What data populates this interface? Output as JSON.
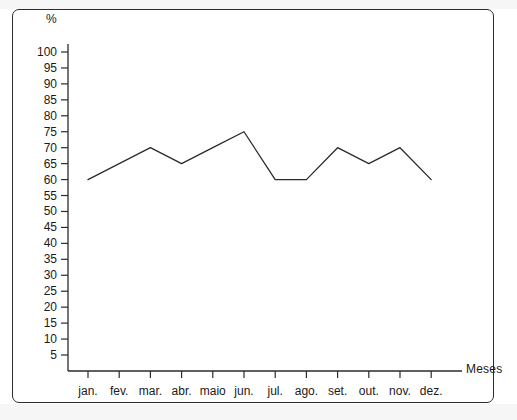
{
  "figure": {
    "y_unit_label": "%",
    "x_axis_label": "Meses"
  },
  "chart_data": {
    "type": "line",
    "title": "",
    "subtitle": "",
    "xlabel": "Meses",
    "ylabel": "%",
    "categories": [
      "jan.",
      "fev.",
      "mar.",
      "abr.",
      "maio",
      "jun.",
      "jul.",
      "ago.",
      "set.",
      "out.",
      "nov.",
      "dez."
    ],
    "values": [
      60,
      65,
      70,
      65,
      70,
      75,
      60,
      60,
      70,
      65,
      70,
      60
    ],
    "series": [
      {
        "name": "",
        "values": [
          60,
          65,
          70,
          65,
          70,
          75,
          60,
          60,
          70,
          65,
          70,
          60
        ]
      }
    ],
    "ylim": [
      0,
      100
    ],
    "ytick_labels": [
      "100",
      "95",
      "90",
      "85",
      "80",
      "75",
      "70",
      "65",
      "60",
      "55",
      "50",
      "45",
      "40",
      "35",
      "30",
      "25",
      "20",
      "15",
      "10",
      "5"
    ],
    "ytick_values": [
      100,
      95,
      90,
      85,
      80,
      75,
      70,
      65,
      60,
      55,
      50,
      45,
      40,
      35,
      30,
      25,
      20,
      15,
      10,
      5
    ],
    "grid": false,
    "legend": "none",
    "line_color": "#2b2b2b",
    "markers": false
  }
}
